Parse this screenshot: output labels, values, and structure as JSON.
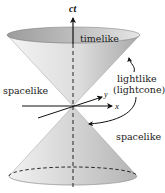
{
  "diagram": {
    "type": "lightcone",
    "axes": {
      "time": "ct",
      "x": "x",
      "y": "y"
    },
    "labels": {
      "timelike": "timelike",
      "spacelike_left": "spacelike",
      "lightlike": "lightlike",
      "lightcone": "(lightcone)",
      "spacelike_right": "spacelike"
    },
    "colors": {
      "cone_light": "#f2f2f2",
      "cone_dark": "#a9a9a9",
      "cone_top_inner": "#b8b8b8",
      "axis": "#111111",
      "background": "#ffffff"
    }
  }
}
